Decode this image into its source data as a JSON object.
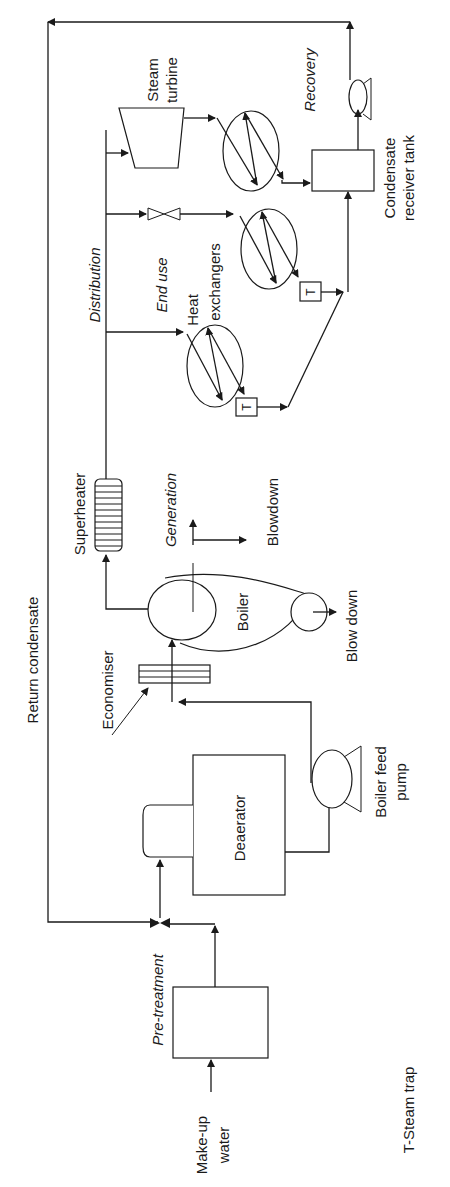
{
  "diagram": {
    "orientation": "rotated-90-ccw",
    "stages": {
      "pre_treatment": "Pre-treatment",
      "generation": "Generation",
      "distribution": "Distribution",
      "end_use": "End use",
      "recovery": "Recovery"
    },
    "components": {
      "makeup_water_line1": "Make-up",
      "makeup_water_line2": "water",
      "deaerator": "Deaerator",
      "boiler_feed_pump_line1": "Boiler feed",
      "boiler_feed_pump_line2": "pump",
      "economiser": "Economiser",
      "boiler": "Boiler",
      "blow_down": "Blow down",
      "blowdown": "Blowdown",
      "superheater": "Superheater",
      "heat_exchangers_line1": "Heat",
      "heat_exchangers_line2": "exchangers",
      "steam_turbine_line1": "Steam",
      "steam_turbine_line2": "turbine",
      "condensate_tank_line1": "Condensate",
      "condensate_tank_line2": "receiver tank",
      "return_condensate": "Return condensate",
      "steam_trap_symbol": "T"
    },
    "legend": {
      "steam_trap": "T-Steam trap"
    },
    "colors": {
      "line": "#1a1a1a",
      "background": "#ffffff"
    }
  }
}
